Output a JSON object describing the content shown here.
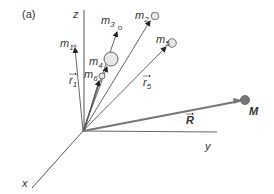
{
  "figure": {
    "panel_label": "(a)",
    "axes": {
      "z_label": "z",
      "y_label": "y",
      "x_label": "x"
    },
    "masses": [
      {
        "name": "m",
        "sub": "1"
      },
      {
        "name": "m",
        "sub": "2"
      },
      {
        "name": "m",
        "sub": "3"
      },
      {
        "name": "m",
        "sub": "4"
      },
      {
        "name": "m",
        "sub": "5"
      },
      {
        "name": "m",
        "sub": "6"
      }
    ],
    "position_vectors": [
      {
        "name": "r",
        "sub": "1"
      },
      {
        "name": "r",
        "sub": "5"
      }
    ],
    "center_of_mass": {
      "vector_label": "R",
      "mass_label": "M"
    },
    "colors": {
      "line": "#555555",
      "thick_vector": "#777777",
      "mass_fill": "#e6e6e6",
      "M_fill": "#777777",
      "text": "#333333"
    }
  }
}
